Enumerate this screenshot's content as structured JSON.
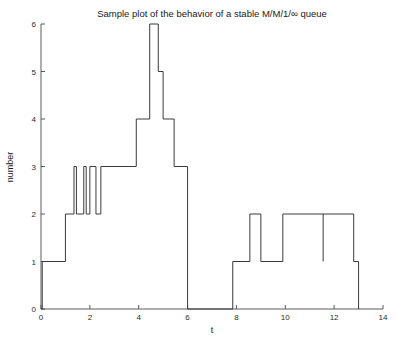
{
  "figure": {
    "background": "#ffffff",
    "line_color": "#3a3a3a",
    "axis_color": "#4a4a4a",
    "text_color": "#1a1a1a"
  },
  "chart_data": {
    "type": "line",
    "subtype": "step-post",
    "title": "Sample plot of the behavior of a stable M/M/1/∞ queue",
    "xlabel": "t",
    "ylabel": "number",
    "xlim": [
      0,
      14
    ],
    "ylim": [
      0,
      6
    ],
    "xticks": [
      0,
      2,
      4,
      6,
      8,
      10,
      12,
      14
    ],
    "xtick_labels": [
      "0",
      "2",
      "4",
      "6",
      "8",
      "10",
      "12",
      "14"
    ],
    "yticks": [
      0,
      1,
      2,
      3,
      4,
      5,
      6
    ],
    "ytick_labels": [
      "0",
      "1",
      "2",
      "3",
      "4",
      "5",
      "6"
    ],
    "grid": false,
    "legend": false,
    "legend_position": "none",
    "series": [
      {
        "name": "queue length N(t)",
        "x": [
          0.0,
          0.05,
          0.8,
          1.0,
          1.35,
          1.45,
          1.75,
          1.85,
          2.0,
          2.25,
          2.45,
          3.0,
          3.85,
          3.95,
          4.05,
          4.55,
          4.65,
          4.8,
          4.9,
          5.0,
          5.45,
          5.65,
          6.0,
          7.85,
          8.0,
          8.55,
          8.95,
          9.0,
          9.9,
          10.0,
          11.55,
          11.6,
          12.4,
          12.8,
          13.0
        ],
        "y": [
          0,
          1,
          1,
          2,
          3,
          2,
          3,
          2,
          3,
          2,
          3,
          4,
          4,
          6,
          6,
          5,
          5,
          4,
          5,
          4,
          4,
          3,
          3,
          0,
          1,
          1,
          2,
          2,
          1,
          1,
          2,
          2,
          2,
          1,
          1
        ],
        "steps": [
          {
            "t_start": 0.0,
            "t_end": 0.05,
            "value": 0
          },
          {
            "t_start": 0.05,
            "t_end": 1.0,
            "value": 1
          },
          {
            "t_start": 1.0,
            "t_end": 1.35,
            "value": 2
          },
          {
            "t_start": 1.35,
            "t_end": 1.45,
            "value": 3
          },
          {
            "t_start": 1.45,
            "t_end": 1.75,
            "value": 2
          },
          {
            "t_start": 1.75,
            "t_end": 1.85,
            "value": 3
          },
          {
            "t_start": 1.85,
            "t_end": 2.0,
            "value": 2
          },
          {
            "t_start": 2.0,
            "t_end": 2.25,
            "value": 3
          },
          {
            "t_start": 2.25,
            "t_end": 2.45,
            "value": 2
          },
          {
            "t_start": 2.45,
            "t_end": 3.9,
            "value": 3
          },
          {
            "t_start": 3.9,
            "t_end": 4.45,
            "value": 4
          },
          {
            "t_start": 4.45,
            "t_end": 4.8,
            "value": 6
          },
          {
            "t_start": 4.8,
            "t_end": 5.0,
            "value": 5
          },
          {
            "t_start": 5.0,
            "t_end": 5.45,
            "value": 4
          },
          {
            "t_start": 5.45,
            "t_end": 6.0,
            "value": 3
          },
          {
            "t_start": 6.0,
            "t_end": 7.85,
            "value": 0
          },
          {
            "t_start": 7.85,
            "t_end": 8.55,
            "value": 1
          },
          {
            "t_start": 8.55,
            "t_end": 9.0,
            "value": 2
          },
          {
            "t_start": 9.0,
            "t_end": 9.9,
            "value": 1
          },
          {
            "t_start": 9.9,
            "t_end": 12.8,
            "value": 2
          },
          {
            "t_start": 12.8,
            "t_end": 13.0,
            "value": 1
          }
        ]
      }
    ],
    "annotations": []
  }
}
